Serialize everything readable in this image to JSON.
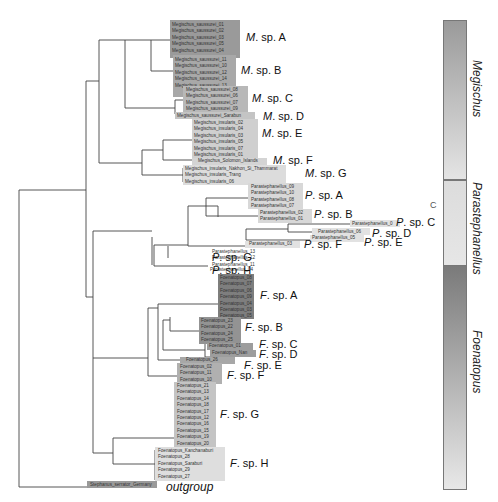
{
  "colors": {
    "line": "#444444",
    "dark": "#8e8e8e",
    "mid": "#b4b4b4",
    "light": "#d6d6d6",
    "lighter": "#e2e2e2"
  },
  "groups": [
    {
      "id": "M-A",
      "label_prefix": "M",
      "label_suffix": ". sp. A",
      "label_x": 246,
      "label_y": 31,
      "box": {
        "x": 170,
        "y": 20,
        "w": 70,
        "h": 38,
        "color": "#9a9a9a"
      },
      "tips": [
        "Megischus_saussurei_01",
        "Megischus_saussurei_02",
        "Megischus_saussurei_03",
        "Megischus_saussurei_05",
        "Megischus_saussurei_04"
      ],
      "tip_x": 172,
      "tip_y": 22
    },
    {
      "id": "M-B",
      "label_prefix": "M",
      "label_suffix": ". sp. B",
      "label_x": 241,
      "label_y": 64,
      "box": {
        "x": 173,
        "y": 55,
        "w": 63,
        "h": 42,
        "color": "#a8a8a8"
      },
      "tips": [
        "Megischus_saussurei_11",
        "Megischus_saussurei_10",
        "Megischus_saussurei_12",
        "Megischus_saussurei_14",
        "Megischus_saussurei_13"
      ],
      "tip_x": 175,
      "tip_y": 57
    },
    {
      "id": "M-C",
      "label_prefix": "M",
      "label_suffix": ". sp. C",
      "label_x": 252,
      "label_y": 92,
      "box": {
        "x": 183,
        "y": 86,
        "w": 65,
        "h": 26,
        "color": "#b8b8b8"
      },
      "tips": [
        "Megischus_saussurei_08",
        "Megischus_saussurei_06",
        "Megischus_saussurei_07",
        "Megischus_saussurei_09"
      ],
      "tip_x": 186,
      "tip_y": 87
    },
    {
      "id": "M-D",
      "label_prefix": "M",
      "label_suffix": ". sp. D",
      "label_x": 263,
      "label_y": 110,
      "box": {
        "x": 175,
        "y": 112,
        "w": 80,
        "h": 7,
        "color": "#c4c4c4"
      },
      "tips": [
        "Megischus_saussurei_Sarabun"
      ],
      "tip_x": 177,
      "tip_y": 113
    },
    {
      "id": "M-E",
      "label_prefix": "M",
      "label_suffix": ". sp. E",
      "label_x": 262,
      "label_y": 127,
      "box": {
        "x": 192,
        "y": 119,
        "w": 66,
        "h": 42,
        "color": "#cfcfcf"
      },
      "tips": [
        "Megischus_insularis_02",
        "Megischus_insularis_04",
        "Megischus_insularis_03",
        "Megischus_insularis_05",
        "Megischus_insularis_07",
        "Megischus_insularis_01"
      ],
      "tip_x": 194,
      "tip_y": 120
    },
    {
      "id": "M-F",
      "label_prefix": "M",
      "label_suffix": ". sp. F",
      "label_x": 273,
      "label_y": 154,
      "box": {
        "x": 192,
        "y": 158,
        "w": 75,
        "h": 7,
        "color": "#d4d4d4"
      },
      "tips": [
        "Megischus_Solomon_Islands"
      ],
      "tip_x": 198,
      "tip_y": 158
    },
    {
      "id": "M-G",
      "label_prefix": "M",
      "label_suffix": ". sp. G",
      "label_x": 305,
      "label_y": 167,
      "box": {
        "x": 183,
        "y": 165,
        "w": 103,
        "h": 20,
        "color": "#dcdcdc"
      },
      "tips": [
        "Megischus_insularis_Nakhon_Si_Thammarat",
        "Megischus_insularis_Trang",
        "Megischus_insularis_06"
      ],
      "tip_x": 185,
      "tip_y": 166
    },
    {
      "id": "P-A",
      "label_prefix": "P",
      "label_suffix": ". sp. A",
      "label_x": 305,
      "label_y": 189,
      "box": {
        "x": 248,
        "y": 183,
        "w": 55,
        "h": 26,
        "color": "#d8d8d8"
      },
      "tips": [
        "Parastephanellus_09",
        "Parastephanellus_10",
        "Parastephanellus_08",
        "Parastephanellus_07"
      ],
      "tip_x": 251,
      "tip_y": 184
    },
    {
      "id": "P-B",
      "label_prefix": "P",
      "label_suffix": ". sp. B",
      "label_x": 314,
      "label_y": 208,
      "box": {
        "x": 258,
        "y": 209,
        "w": 54,
        "h": 14,
        "color": "#d8d8d8"
      },
      "tips": [
        "Parastephanellus_02",
        "Parastephanellus_01"
      ],
      "tip_x": 260,
      "tip_y": 210
    },
    {
      "id": "P-C",
      "label_prefix": "P",
      "label_suffix": ". sp. C",
      "label_x": 396,
      "label_y": 216,
      "box": {
        "x": 350,
        "y": 220,
        "w": 50,
        "h": 7,
        "color": "#e2e2e2"
      },
      "tips": [
        "Parastephanellus_0"
      ],
      "tip_x": 352,
      "tip_y": 221
    },
    {
      "id": "P-D",
      "label_prefix": "P",
      "label_suffix": ". sp. D",
      "label_x": 372,
      "label_y": 227,
      "box": {
        "x": 312,
        "y": 228,
        "w": 58,
        "h": 7,
        "color": "#e2e2e2"
      },
      "tips": [
        "Parastephanellus_06"
      ],
      "tip_x": 318,
      "tip_y": 229
    },
    {
      "id": "P-E",
      "label_prefix": "P",
      "label_suffix": ". sp. E",
      "label_x": 364,
      "label_y": 236,
      "box": {
        "x": 310,
        "y": 235,
        "w": 54,
        "h": 7,
        "color": "#e2e2e2"
      },
      "tips": [
        "Parastephanellus_05"
      ],
      "tip_x": 312,
      "tip_y": 235
    },
    {
      "id": "P-F",
      "label_prefix": "P",
      "label_suffix": ". sp. F",
      "label_x": 304,
      "label_y": 238,
      "box": {
        "x": 245,
        "y": 241,
        "w": 55,
        "h": 7,
        "color": "#e2e2e2"
      },
      "tips": [
        "Parastephanellus_03"
      ],
      "tip_x": 249,
      "tip_y": 241
    },
    {
      "id": "P-G",
      "label_prefix": "P",
      "label_suffix": ". sp. G",
      "label_x": 212,
      "label_y": 251,
      "box": {
        "x": 210,
        "y": 249,
        "w": 0,
        "h": 0,
        "color": "transparent"
      },
      "tips": [
        "Parastephanellus_13",
        "Parastephanellus_12",
        "Parastephanellus_11"
      ],
      "tip_x": 212,
      "tip_y": 249
    },
    {
      "id": "P-H",
      "label_prefix": "P",
      "label_suffix": ". sp. H",
      "label_x": 212,
      "label_y": 264,
      "box": {
        "x": 208,
        "y": 267,
        "w": 0,
        "h": 0,
        "color": "transparent"
      },
      "tips": [
        "Parastephanellus_04"
      ],
      "tip_x": 210,
      "tip_y": 267
    },
    {
      "id": "F-A",
      "label_prefix": "F",
      "label_suffix": ". sp. A",
      "label_x": 260,
      "label_y": 289,
      "box": {
        "x": 218,
        "y": 274,
        "w": 36,
        "h": 45,
        "color": "#7e7e7e"
      },
      "tips": [
        "Foenatopus_08",
        "Foenatopus_07",
        "Foenatopus_06",
        "Foenatopus_09",
        "Foenatopus_04",
        "Foenatopus_03",
        "Foenatopus_05"
      ],
      "tip_x": 220,
      "tip_y": 275
    },
    {
      "id": "F-B",
      "label_prefix": "F",
      "label_suffix": ". sp. B",
      "label_x": 245,
      "label_y": 321,
      "box": {
        "x": 199,
        "y": 317,
        "w": 42,
        "h": 27,
        "color": "#939393"
      },
      "tips": [
        "Foenatopus_23",
        "Foenatopus_22",
        "Foenatopus_24",
        "Foenatopus_25"
      ],
      "tip_x": 201,
      "tip_y": 318
    },
    {
      "id": "F-C",
      "label_prefix": "F",
      "label_suffix": ". sp. C",
      "label_x": 259,
      "label_y": 338,
      "box": {
        "x": 207,
        "y": 343,
        "w": 46,
        "h": 7,
        "color": "#9d9d9d"
      },
      "tips": [
        "Foenatopus_01"
      ],
      "tip_x": 209,
      "tip_y": 343
    },
    {
      "id": "F-D",
      "label_prefix": "F",
      "label_suffix": ". sp. D",
      "label_x": 259,
      "label_y": 348,
      "box": {
        "x": 210,
        "y": 350,
        "w": 46,
        "h": 7,
        "color": "#9d9d9d"
      },
      "tips": [
        "Foenatopus_Nan"
      ],
      "tip_x": 212,
      "tip_y": 350
    },
    {
      "id": "F-E",
      "label_prefix": "F",
      "label_suffix": ". sp. E",
      "label_x": 244,
      "label_y": 359,
      "box": {
        "x": 180,
        "y": 357,
        "w": 55,
        "h": 7,
        "color": "#a7a7a7"
      },
      "tips": [
        "Foenatopus_26"
      ],
      "tip_x": 186,
      "tip_y": 357
    },
    {
      "id": "F-F",
      "label_prefix": "F",
      "label_suffix": ". sp. F",
      "label_x": 227,
      "label_y": 369,
      "box": {
        "x": 177,
        "y": 363,
        "w": 45,
        "h": 21,
        "color": "#b0b0b0"
      },
      "tips": [
        "Foenatopus_02",
        "Foenatopus_11",
        "Foenatopus_10"
      ],
      "tip_x": 180,
      "tip_y": 364
    },
    {
      "id": "F-G",
      "label_prefix": "F",
      "label_suffix": ". sp. G",
      "label_x": 220,
      "label_y": 408,
      "box": {
        "x": 174,
        "y": 382,
        "w": 42,
        "h": 66,
        "color": "#c4c4c4"
      },
      "tips": [
        "Foenatopus_21",
        "Foenatopus_13",
        "Foenatopus_14",
        "Foenatopus_18",
        "Foenatopus_17",
        "Foenatopus_12",
        "Foenatopus_16",
        "Foenatopus_15",
        "Foenatopus_19",
        "Foenatopus_20"
      ],
      "tip_x": 177,
      "tip_y": 383
    },
    {
      "id": "F-H",
      "label_prefix": "F",
      "label_suffix": ". sp. H",
      "label_x": 230,
      "label_y": 457,
      "box": {
        "x": 155,
        "y": 447,
        "w": 70,
        "h": 34,
        "color": "#dedede"
      },
      "tips": [
        "Foenatopus_Kanchanaburi",
        "Foenatopus_28",
        "Foenatopus_Saraburi",
        "Foenatopus_29",
        "Foenatopus_27"
      ],
      "tip_x": 158,
      "tip_y": 448
    }
  ],
  "outgroup": {
    "tip": "Stephanus_serrator_Germany",
    "label": "outgroup",
    "box": {
      "x": 87,
      "y": 481,
      "w": 70,
      "h": 7,
      "color": "#9a9a9a"
    },
    "tip_x": 90,
    "tip_y": 482,
    "label_x": 166,
    "label_y": 480
  },
  "genera": [
    {
      "name": "Megischus",
      "top": 20,
      "height": 160,
      "grad_top": "#9a9a9a",
      "grad_bottom": "#e4e4e4",
      "label_top": 60
    },
    {
      "name": "Parastephanellus",
      "top": 180,
      "height": 86,
      "grad_top": "#dcdcdc",
      "grad_bottom": "#e6e6e6",
      "label_top": 182
    },
    {
      "name": "Foenatopus",
      "top": 265,
      "height": 225,
      "grad_top": "#7a7a7a",
      "grad_bottom": "#e8e8e8",
      "label_top": 330
    }
  ],
  "stray_mark": "C",
  "branches": [
    [
      19,
      190,
      19,
      487
    ],
    [
      19,
      190,
      86,
      190
    ],
    [
      19,
      487,
      88,
      487
    ],
    [
      86,
      81,
      86,
      297
    ],
    [
      86,
      81,
      99,
      81
    ],
    [
      86,
      297,
      93,
      297
    ],
    [
      99,
      40,
      99,
      163
    ],
    [
      99,
      40,
      125,
      40
    ],
    [
      99,
      163,
      142,
      163
    ],
    [
      125,
      40,
      125,
      108
    ],
    [
      125,
      40,
      151,
      40
    ],
    [
      125,
      108,
      175,
      108
    ],
    [
      151,
      40,
      151,
      71
    ],
    [
      151,
      40,
      170,
      40
    ],
    [
      151,
      71,
      173,
      71
    ],
    [
      175,
      100,
      175,
      114
    ],
    [
      175,
      100,
      183,
      100
    ],
    [
      175,
      114,
      175,
      114
    ],
    [
      142,
      150,
      142,
      175
    ],
    [
      142,
      150,
      163,
      150
    ],
    [
      142,
      175,
      183,
      175
    ],
    [
      163,
      140,
      163,
      160
    ],
    [
      163,
      140,
      192,
      140
    ],
    [
      163,
      160,
      192,
      160
    ],
    [
      183,
      168,
      183,
      182
    ],
    [
      93,
      231,
      93,
      297
    ],
    [
      93,
      231,
      152,
      231
    ],
    [
      152,
      237,
      152,
      265
    ],
    [
      154,
      245,
      154,
      266
    ],
    [
      154,
      245,
      188,
      245
    ],
    [
      154,
      266,
      208,
      266
    ],
    [
      168,
      246,
      168,
      258
    ],
    [
      188,
      206,
      188,
      246
    ],
    [
      188,
      206,
      218,
      206
    ],
    [
      188,
      246,
      246,
      246
    ],
    [
      206,
      198,
      206,
      216
    ],
    [
      206,
      198,
      248,
      198
    ],
    [
      206,
      216,
      258,
      216
    ],
    [
      218,
      206,
      218,
      217
    ],
    [
      246,
      229,
      246,
      240
    ],
    [
      246,
      229,
      288,
      229
    ],
    [
      246,
      240,
      310,
      240
    ],
    [
      288,
      224,
      288,
      232
    ],
    [
      288,
      224,
      350,
      224
    ],
    [
      288,
      232,
      312,
      232
    ],
    [
      93,
      297,
      93,
      453
    ],
    [
      93,
      358,
      148,
      358
    ],
    [
      93,
      453,
      113,
      453
    ],
    [
      148,
      308,
      148,
      376
    ],
    [
      148,
      308,
      158,
      308
    ],
    [
      148,
      376,
      177,
      376
    ],
    [
      158,
      304,
      158,
      360
    ],
    [
      158,
      304,
      218,
      304
    ],
    [
      158,
      360,
      180,
      360
    ],
    [
      163,
      320,
      163,
      350
    ],
    [
      163,
      320,
      170,
      320
    ],
    [
      163,
      350,
      205,
      350
    ],
    [
      170,
      317,
      170,
      331
    ],
    [
      170,
      331,
      199,
      331
    ],
    [
      205,
      343,
      205,
      357
    ],
    [
      205,
      343,
      207,
      343
    ],
    [
      205,
      357,
      210,
      357
    ],
    [
      113,
      438,
      113,
      464
    ],
    [
      113,
      438,
      175,
      438
    ],
    [
      113,
      464,
      155,
      464
    ],
    [
      175,
      410,
      175,
      438
    ],
    [
      155,
      450,
      155,
      480
    ]
  ]
}
